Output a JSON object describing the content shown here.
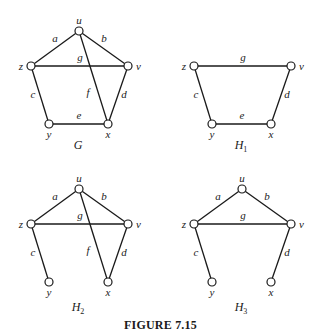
{
  "caption": "FIGURE 7.15",
  "graphs": [
    {
      "name": "G",
      "subscript": "",
      "vertices": [
        "u",
        "v",
        "x",
        "y",
        "z"
      ],
      "edges": [
        {
          "label": "a",
          "from": "z",
          "to": "u"
        },
        {
          "label": "b",
          "from": "u",
          "to": "v"
        },
        {
          "label": "c",
          "from": "z",
          "to": "y"
        },
        {
          "label": "d",
          "from": "v",
          "to": "x"
        },
        {
          "label": "e",
          "from": "y",
          "to": "x"
        },
        {
          "label": "f",
          "from": "u",
          "to": "x"
        },
        {
          "label": "g",
          "from": "z",
          "to": "v"
        }
      ]
    },
    {
      "name": "H",
      "subscript": "1",
      "vertices": [
        "v",
        "x",
        "y",
        "z"
      ],
      "edges": [
        {
          "label": "c",
          "from": "z",
          "to": "y"
        },
        {
          "label": "d",
          "from": "v",
          "to": "x"
        },
        {
          "label": "e",
          "from": "y",
          "to": "x"
        },
        {
          "label": "g",
          "from": "z",
          "to": "v"
        }
      ]
    },
    {
      "name": "H",
      "subscript": "2",
      "vertices": [
        "u",
        "v",
        "x",
        "y",
        "z"
      ],
      "edges": [
        {
          "label": "a",
          "from": "z",
          "to": "u"
        },
        {
          "label": "b",
          "from": "u",
          "to": "v"
        },
        {
          "label": "c",
          "from": "z",
          "to": "y"
        },
        {
          "label": "d",
          "from": "v",
          "to": "x"
        },
        {
          "label": "f",
          "from": "u",
          "to": "x"
        },
        {
          "label": "g",
          "from": "z",
          "to": "v"
        }
      ]
    },
    {
      "name": "H",
      "subscript": "3",
      "vertices": [
        "u",
        "v",
        "x",
        "y",
        "z"
      ],
      "edges": [
        {
          "label": "a",
          "from": "z",
          "to": "u"
        },
        {
          "label": "b",
          "from": "u",
          "to": "v"
        },
        {
          "label": "c",
          "from": "z",
          "to": "y"
        },
        {
          "label": "d",
          "from": "v",
          "to": "x"
        },
        {
          "label": "g",
          "from": "z",
          "to": "v"
        }
      ]
    }
  ]
}
